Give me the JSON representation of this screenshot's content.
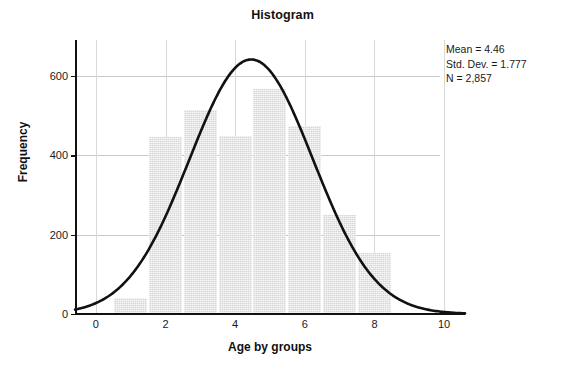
{
  "chart_data": {
    "type": "bar",
    "title": "Histogram",
    "xlabel": "Age by groups",
    "ylabel": "Frequency",
    "xlim": [
      -0.6,
      10.6
    ],
    "ylim": [
      0,
      690
    ],
    "grid": true,
    "legend": "none",
    "xticks": [
      0,
      2,
      4,
      6,
      8,
      10
    ],
    "xtick_labels": [
      "0",
      "2",
      "4",
      "6",
      "8",
      "10"
    ],
    "yticks": [
      0,
      200,
      400,
      600
    ],
    "ytick_labels": [
      "0",
      "200",
      "400",
      "600"
    ],
    "bin_width": 1,
    "bin_centers": [
      1,
      2,
      3,
      4,
      5,
      6,
      7,
      8
    ],
    "bin_edges": [
      0.5,
      1.5,
      2.5,
      3.5,
      4.5,
      5.5,
      6.5,
      7.5,
      8.5
    ],
    "categories": [
      "0.5-1.5",
      "1.5-2.5",
      "2.5-3.5",
      "3.5-4.5",
      "4.5-5.5",
      "5.5-6.5",
      "6.5-7.5",
      "7.5-8.5"
    ],
    "values": [
      37,
      442,
      510,
      445,
      565,
      470,
      248,
      150
    ],
    "bar_color": "#d6d6d6",
    "overlay": {
      "type": "line",
      "name": "normal-curve",
      "color": "#111111",
      "mean": 4.46,
      "std_dev": 1.777,
      "peak_value": 641
    },
    "annotations": {
      "mean_label": "Mean = 4.46",
      "std_dev_label": "Std. Dev. = 1.777",
      "n_label": "N = 2,857"
    }
  },
  "stats": {
    "mean": "Mean = 4.46",
    "std_dev": "Std. Dev. = 1.777",
    "n": "N = 2,857"
  },
  "axes": {
    "x_title": "Age by groups",
    "y_title": "Frequency"
  },
  "title": "Histogram"
}
